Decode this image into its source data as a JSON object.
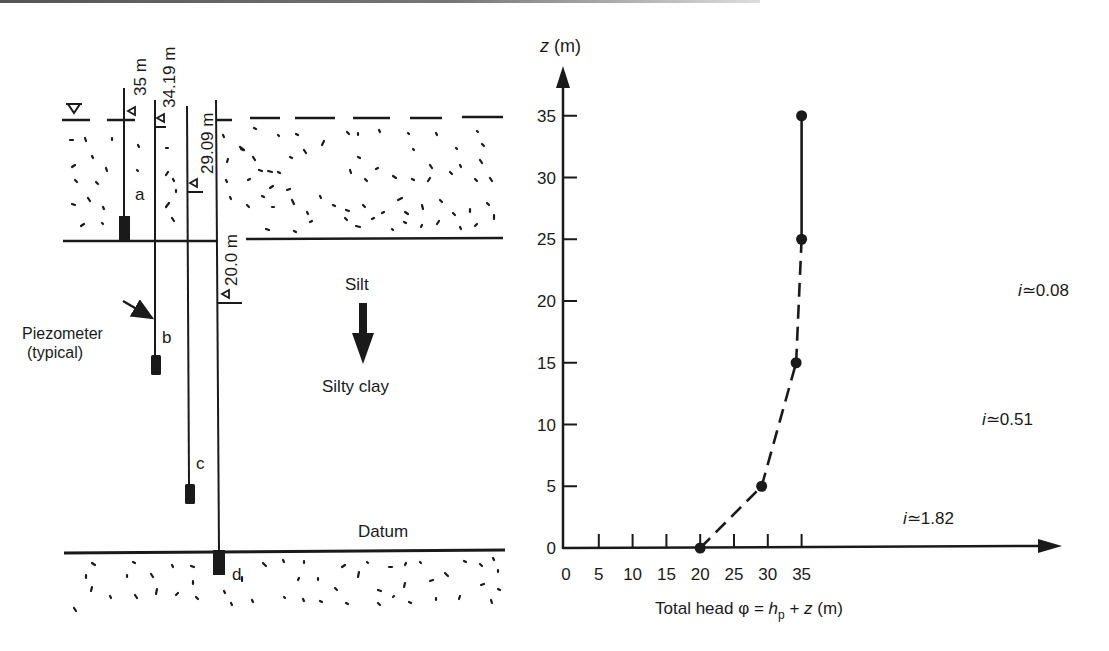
{
  "left_panel": {
    "labels": {
      "silt": "Silt",
      "silty_clay": "Silty clay",
      "datum": "Datum",
      "piezometer_line1": "Piezometer",
      "piezometer_line2": "(typical)"
    },
    "piezometers": [
      {
        "id": "a",
        "reading": "35 m"
      },
      {
        "id": "b",
        "reading": "34.19 m"
      },
      {
        "id": "c",
        "reading": "29.09 m"
      },
      {
        "id": "d",
        "reading": "20.0 m"
      }
    ]
  },
  "chart_data": {
    "type": "line",
    "title": "",
    "xlabel": "Total head φ = h_p + z (m)",
    "ylabel": "z (m)",
    "xlim": [
      0,
      38
    ],
    "ylim": [
      0,
      37
    ],
    "x_ticks": [
      0,
      5,
      10,
      15,
      20,
      25,
      30,
      35
    ],
    "y_ticks": [
      0,
      5,
      10,
      15,
      20,
      25,
      30,
      35
    ],
    "grid": false,
    "points": [
      {
        "phi": 20.0,
        "z": 0
      },
      {
        "phi": 29.09,
        "z": 5
      },
      {
        "phi": 34.19,
        "z": 15
      },
      {
        "phi": 35.0,
        "z": 25
      },
      {
        "phi": 35.0,
        "z": 35
      }
    ],
    "segments": [
      {
        "from": 0,
        "to": 1,
        "style": "dashed",
        "annotation": "i≃1.82"
      },
      {
        "from": 1,
        "to": 2,
        "style": "dashed",
        "annotation": "i≃0.51"
      },
      {
        "from": 2,
        "to": 3,
        "style": "dashed",
        "annotation": "i≃0.08"
      },
      {
        "from": 3,
        "to": 4,
        "style": "solid",
        "annotation": ""
      }
    ]
  },
  "chart_text": {
    "ylabel_var": "z",
    "ylabel_unit": " (m)",
    "xlabel_prefix": "Total head φ = ",
    "xlabel_h": "h",
    "xlabel_sub": "p",
    "xlabel_plus": " + ",
    "xlabel_z": "z",
    "xlabel_unit": " (m)",
    "annotations": {
      "i182_var": "i",
      "i182_val": "≃1.82",
      "i051_var": "i",
      "i051_val": "≃0.51",
      "i008_var": "i",
      "i008_val": "≃0.08"
    },
    "x_tick_labels": [
      "0",
      "5",
      "10",
      "15",
      "20",
      "25",
      "30",
      "35"
    ],
    "y_tick_labels": [
      "0",
      "5",
      "10",
      "15",
      "20",
      "25",
      "30",
      "35"
    ]
  }
}
